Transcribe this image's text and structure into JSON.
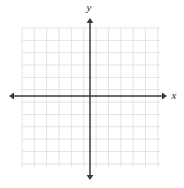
{
  "figure": {
    "kind": "cartesian-coordinate-plane",
    "width": 184,
    "height": 188,
    "background_color": "#ffffff"
  },
  "axes": {
    "x_axis": {
      "label": "x",
      "label_x": 174,
      "label_y": 99,
      "line_y": 96,
      "start_x": 9,
      "end_x": 167,
      "color": "#3a3a3a",
      "stroke_width": 1.5,
      "arrow_start": true,
      "arrow_end": true
    },
    "y_axis": {
      "label": "y",
      "label_x": 89,
      "label_y": 11,
      "line_x": 90,
      "start_y": 18,
      "end_y": 180,
      "color": "#3a3a3a",
      "stroke_width": 1.5,
      "arrow_start": true,
      "arrow_end": true
    }
  },
  "grid": {
    "left": 22,
    "top": 28,
    "right": 160,
    "bottom": 167,
    "cell_size": 12.35,
    "columns": 11,
    "rows": 11,
    "color": "#e3e3e3",
    "stroke_width": 1,
    "show_ticks": false,
    "tick_labels": []
  },
  "chart_data": {
    "type": "scatter",
    "title": "",
    "subtitle": "",
    "xlabel": "x",
    "ylabel": "y",
    "series": [],
    "x": [],
    "values": [],
    "categories": [],
    "annotations": [],
    "legend": [],
    "legend_position": "none",
    "grid": true,
    "xlim": [
      -5.5,
      5.7
    ],
    "ylim": [
      -5.8,
      5.5
    ],
    "xticks": [],
    "yticks": []
  }
}
